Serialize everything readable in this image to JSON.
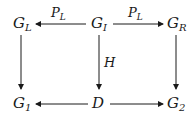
{
  "diagram": {
    "type": "commutative-diagram",
    "nodes": {
      "GL": {
        "base": "G",
        "sub": "L"
      },
      "GI": {
        "base": "G",
        "sub": "I"
      },
      "GR": {
        "base": "G",
        "sub": "R"
      },
      "G1": {
        "base": "G",
        "sub": "1"
      },
      "D": {
        "base": "D",
        "sub": ""
      },
      "G2": {
        "base": "G",
        "sub": "2"
      }
    },
    "edges": [
      {
        "from": "GI",
        "to": "GL",
        "label": {
          "base": "P",
          "sub": "L"
        }
      },
      {
        "from": "GI",
        "to": "GR",
        "label": {
          "base": "P",
          "sub": "L"
        }
      },
      {
        "from": "GL",
        "to": "G1",
        "label": null
      },
      {
        "from": "GI",
        "to": "D",
        "label": {
          "base": "H",
          "sub": ""
        }
      },
      {
        "from": "GR",
        "to": "G2",
        "label": null
      },
      {
        "from": "D",
        "to": "G1",
        "label": null
      },
      {
        "from": "D",
        "to": "G2",
        "label": null
      }
    ],
    "color": "#1a1a1a"
  }
}
